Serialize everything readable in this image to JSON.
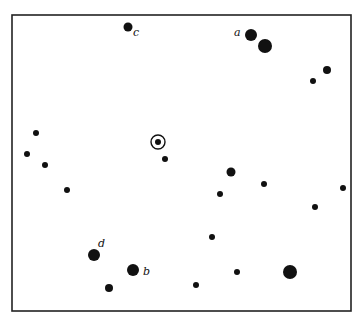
{
  "chart_data": {
    "type": "scatter",
    "title": "",
    "frame": {
      "x1": 12,
      "y1": 15,
      "x2": 351,
      "y2": 311
    },
    "target": {
      "x": 158,
      "y": 142,
      "ring_r": 7,
      "dot_r": 3
    },
    "labelled_stars": [
      {
        "label": "a",
        "x": 251,
        "y": 35,
        "r": 6,
        "label_x": 234,
        "label_y": 36
      },
      {
        "label": "b",
        "x": 133,
        "y": 270,
        "r": 6,
        "label_x": 143,
        "label_y": 275
      },
      {
        "label": "c",
        "x": 128,
        "y": 27,
        "r": 4.5,
        "label_x": 133,
        "label_y": 36
      },
      {
        "label": "d",
        "x": 94,
        "y": 255,
        "r": 6,
        "label_x": 98,
        "label_y": 247
      }
    ],
    "stars": [
      {
        "x": 265,
        "y": 46,
        "r": 7
      },
      {
        "x": 327,
        "y": 70,
        "r": 4
      },
      {
        "x": 313,
        "y": 81,
        "r": 3
      },
      {
        "x": 36,
        "y": 133,
        "r": 3
      },
      {
        "x": 27,
        "y": 154,
        "r": 3
      },
      {
        "x": 45,
        "y": 165,
        "r": 3
      },
      {
        "x": 67,
        "y": 190,
        "r": 3
      },
      {
        "x": 165,
        "y": 159,
        "r": 3
      },
      {
        "x": 231,
        "y": 172,
        "r": 4.5
      },
      {
        "x": 264,
        "y": 184,
        "r": 3
      },
      {
        "x": 220,
        "y": 194,
        "r": 3
      },
      {
        "x": 343,
        "y": 188,
        "r": 3
      },
      {
        "x": 315,
        "y": 207,
        "r": 3
      },
      {
        "x": 212,
        "y": 237,
        "r": 3
      },
      {
        "x": 109,
        "y": 288,
        "r": 4
      },
      {
        "x": 237,
        "y": 272,
        "r": 3
      },
      {
        "x": 290,
        "y": 272,
        "r": 7
      },
      {
        "x": 196,
        "y": 285,
        "r": 3
      }
    ]
  },
  "colors": {
    "ink": "#111111",
    "background": "#ffffff"
  }
}
